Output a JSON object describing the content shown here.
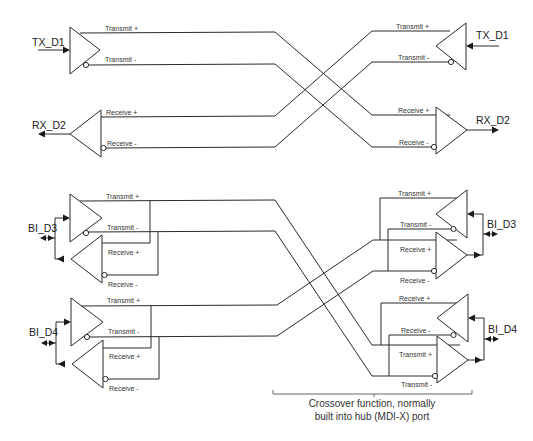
{
  "diagram": {
    "ports": {
      "left_tx": "TX_D1",
      "left_rx": "RX_D2",
      "right_tx": "TX_D1",
      "right_rx": "RX_D2",
      "left_bi3": "BI_D3",
      "left_bi4": "BI_D4",
      "right_bi3": "BI_D3",
      "right_bi4": "BI_D4"
    },
    "signals": {
      "transmit_plus": "Transmit +",
      "transmit_minus": "Transmit -",
      "receive_plus": "Receive +",
      "receive_minus": "Receive -"
    },
    "caption": {
      "line1": "Crossover function, normally",
      "line2": "built into hub (MDI-X) port"
    }
  }
}
